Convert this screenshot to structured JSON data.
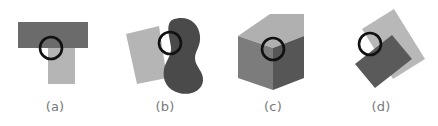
{
  "figure": {
    "width": 438,
    "height": 126,
    "background": "#ffffff"
  },
  "colors": {
    "background": "#ffffff",
    "dark_gray": "#6b6b6b",
    "light_gray": "#b5b5b5",
    "blob_dark": "#4a4a4a",
    "cube_top": "#b0b0b0",
    "cube_left": "#7c7c7c",
    "cube_right": "#565656",
    "rect_light": "#b8b8b8",
    "rect_dark": "#5a5a5a",
    "circle_stroke": "#111111",
    "label_text": "#77797b"
  },
  "panels": [
    {
      "id": "a",
      "label": "(a)",
      "name": "t-junction-panel",
      "shapes": [
        {
          "name": "horizontal-bar",
          "type": "rect",
          "fill": "#6b6b6b",
          "x": 18,
          "y": 22,
          "width": 70,
          "height": 26
        },
        {
          "name": "vertical-stem",
          "type": "rect",
          "fill": "#b5b5b5",
          "x": 48,
          "y": 48,
          "width": 27,
          "height": 36
        }
      ],
      "marker": {
        "name": "junction-circle",
        "cx": 51,
        "cy": 48,
        "r": 11,
        "stroke": "#111111",
        "stroke_width": 2.6
      }
    },
    {
      "id": "b",
      "label": "(b)",
      "name": "occluding-blob-panel",
      "shapes": [
        {
          "name": "tilted-quadrilateral",
          "type": "polygon",
          "fill": "#b5b5b5",
          "points": "16,34 49,26 57,78 27,84"
        },
        {
          "name": "peanut-blob",
          "type": "path",
          "fill": "#4a4a4a",
          "path": "M 62 20 C 76 14 89 22 90 36 C 91 46 85 51 85 58 C 85 67 94 71 93 81 C 92 91 80 96 69 93 C 57 90 52 80 54 69 C 56 60 62 55 61 47 C 60 38 55 25 62 20 Z"
        }
      ],
      "marker": {
        "name": "occlusion-circle",
        "cx": 60,
        "cy": 43,
        "r": 11,
        "stroke": "#111111",
        "stroke_width": 2.6
      }
    },
    {
      "id": "c",
      "label": "(c)",
      "name": "cube-vertex-panel",
      "shapes": [
        {
          "name": "cube-top-face",
          "type": "polygon",
          "fill": "#b0b0b0",
          "points": "52,14 86,14 70,36 20,36"
        },
        {
          "name": "cube-left-face",
          "type": "polygon",
          "fill": "#7c7c7c",
          "points": "20,36 55,48 55,90 20,78"
        },
        {
          "name": "cube-right-face",
          "type": "polygon",
          "fill": "#565656",
          "points": "55,48 86,36 86,78 55,90"
        },
        {
          "name": "cube-top-right-wedge",
          "type": "polygon",
          "fill": "#b0b0b0",
          "points": "70,36 86,14 86,36"
        },
        {
          "name": "cube-top-left-wedge",
          "type": "polygon",
          "fill": "#b0b0b0",
          "points": "20,36 52,14 55,48"
        }
      ],
      "marker": {
        "name": "vertex-circle",
        "cx": 55,
        "cy": 49,
        "r": 11,
        "stroke": "#111111",
        "stroke_width": 2.6
      }
    },
    {
      "id": "d",
      "label": "(d)",
      "name": "crossing-rectangles-panel",
      "shapes": [
        {
          "name": "light-rectangle",
          "type": "polygon",
          "fill": "#b8b8b8",
          "points": "36,29 68,9 99,59 67,79"
        },
        {
          "name": "dark-rectangle",
          "type": "polygon",
          "fill": "#5a5a5a",
          "points": "29,64 66,35 86,59 49,88"
        }
      ],
      "marker": {
        "name": "corner-circle",
        "cx": 44,
        "cy": 44,
        "r": 11,
        "stroke": "#111111",
        "stroke_width": 2.6
      }
    }
  ]
}
